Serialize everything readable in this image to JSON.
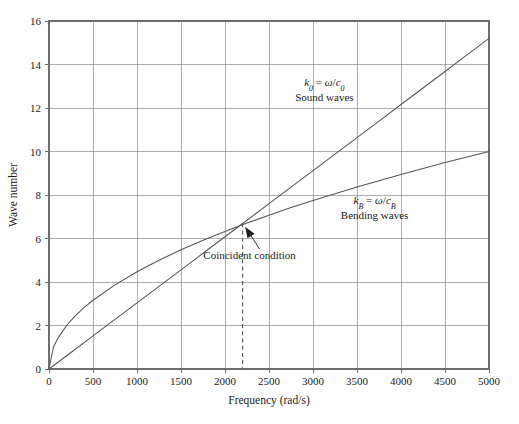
{
  "chart_data": {
    "type": "line",
    "title": "",
    "xlabel": "Frequency (rad/s)",
    "ylabel": "Wave number",
    "xlim": [
      0,
      5000
    ],
    "ylim": [
      0,
      16
    ],
    "grid": true,
    "legend": "inline-annotations",
    "xticks": [
      0,
      500,
      1000,
      1500,
      2000,
      2500,
      3000,
      3500,
      4000,
      4500,
      5000
    ],
    "xtick_labels": [
      "0",
      "500",
      "1000",
      "1500",
      "2000",
      "2500",
      "3000",
      "3500",
      "4000",
      "4500",
      "5000"
    ],
    "yticks": [
      0,
      2,
      4,
      6,
      8,
      10,
      12,
      14,
      16
    ],
    "ytick_labels": [
      "0",
      "2",
      "4",
      "6",
      "8",
      "10",
      "12",
      "14",
      "16"
    ],
    "series": [
      {
        "name": "Sound waves",
        "label_math": "k0 = ω/c0",
        "relation": "linear",
        "x": [
          0,
          250,
          500,
          750,
          1000,
          1250,
          1500,
          1750,
          2000,
          2250,
          2500,
          2750,
          3000,
          3250,
          3500,
          3750,
          4000,
          4250,
          4500,
          4750,
          5000
        ],
        "values": [
          0,
          0.76,
          1.52,
          2.28,
          3.04,
          3.8,
          4.56,
          5.32,
          6.08,
          6.84,
          7.6,
          8.36,
          9.12,
          9.88,
          10.64,
          11.4,
          12.16,
          12.92,
          13.68,
          14.44,
          15.2
        ]
      },
      {
        "name": "Bending waves",
        "label_math": "kB = ω/cB",
        "relation": "square-root",
        "x": [
          0,
          50,
          100,
          200,
          300,
          400,
          500,
          750,
          1000,
          1250,
          1500,
          1750,
          2000,
          2250,
          2500,
          2750,
          3000,
          3250,
          3500,
          3750,
          4000,
          4250,
          4500,
          4750,
          5000
        ],
        "values": [
          0,
          1.0,
          1.41,
          2.0,
          2.45,
          2.83,
          3.16,
          3.87,
          4.47,
          5.0,
          5.48,
          5.92,
          6.32,
          6.71,
          7.07,
          7.42,
          7.75,
          8.06,
          8.37,
          8.66,
          8.94,
          9.22,
          9.49,
          9.75,
          10.0
        ]
      }
    ],
    "annotations": [
      {
        "name": "sound-waves-label",
        "math": "k0 = ω/c0",
        "text": "Sound waves",
        "x": 3130,
        "y": 13.0
      },
      {
        "name": "bending-waves-label",
        "math": "kB = ω/cB",
        "text": "Bending waves",
        "x": 3700,
        "y": 7.6
      },
      {
        "name": "coincident-condition-label",
        "text": "Coincident condition",
        "x": 2280,
        "y": 5.05
      }
    ],
    "coincident_point": {
      "x": 2200,
      "y": 6.7,
      "label": "Coincident condition",
      "dashed_drop_to": 0
    }
  },
  "labels": {
    "y_axis_title": "Wave number",
    "x_axis_title": "Frequency (rad/s)",
    "sound_math_k": "k",
    "sound_math_sub": "0",
    "sound_math_eq": " = ",
    "sound_math_omega": "ω",
    "sound_math_slash": "/",
    "sound_math_c": "c",
    "sound_math_csub": "0",
    "sound_name": "Sound waves",
    "bending_math_k": "k",
    "bending_math_sub": "B",
    "bending_math_eq": " = ",
    "bending_math_omega": "ω",
    "bending_math_slash": "/",
    "bending_math_c": "c",
    "bending_math_csub": "B",
    "bending_name": "Bending waves",
    "coincident": "Coincident condition"
  },
  "colors": {
    "background": "#ffffff",
    "grid": "#8c8c8c",
    "frame": "#6e6e6e",
    "curve": "#555555",
    "text": "#1a1a1a"
  }
}
